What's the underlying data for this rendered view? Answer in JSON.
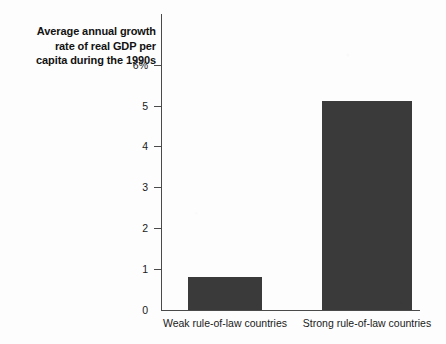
{
  "chart_data": {
    "type": "bar",
    "title": "Average annual growth rate of real GDP per capita during the 1990s",
    "title_lines": [
      "Average annual growth",
      "rate of real GDP per",
      "capita during the 1990s"
    ],
    "categories": [
      "Weak rule-of-law countries",
      "Strong rule-of-law countries"
    ],
    "values": [
      0.8,
      5.1
    ],
    "xlabel": "",
    "ylabel": "",
    "ylim": [
      0,
      6
    ],
    "yticks": [
      0,
      1,
      2,
      3,
      4,
      5,
      6
    ],
    "ytick_labels": [
      "0",
      "1",
      "2",
      "3",
      "4",
      "5",
      "6%"
    ],
    "unit": "%",
    "grid": false,
    "legend": false,
    "bar_color": "#3a3a3a",
    "axis_color": "#4a4a4a",
    "background_color": "#fdfdfd"
  }
}
